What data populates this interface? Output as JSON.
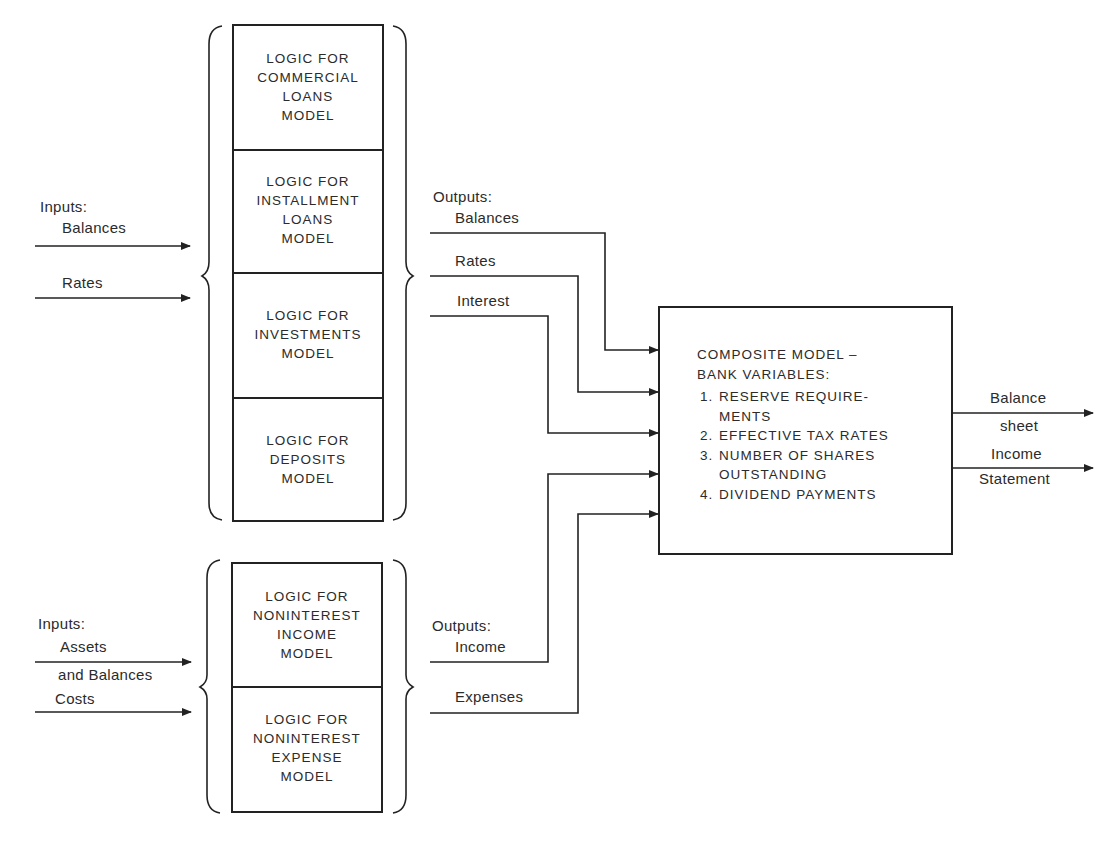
{
  "upper_group": {
    "inputs": {
      "heading": "Inputs:",
      "items": [
        "Balances",
        "Rates"
      ]
    },
    "models": [
      {
        "lines": [
          "LOGIC FOR",
          "COMMERCIAL",
          "LOANS",
          "MODEL"
        ]
      },
      {
        "lines": [
          "LOGIC FOR",
          "INSTALLMENT",
          "LOANS",
          "MODEL"
        ]
      },
      {
        "lines": [
          "LOGIC FOR",
          "INVESTMENTS",
          "MODEL"
        ]
      },
      {
        "lines": [
          "LOGIC FOR",
          "DEPOSITS",
          "MODEL"
        ]
      }
    ],
    "outputs": {
      "heading": "Outputs:",
      "items": [
        "Balances",
        "Rates",
        "Interest"
      ]
    }
  },
  "lower_group": {
    "inputs": {
      "heading": "Inputs:",
      "items": [
        "Assets",
        "and Balances",
        "Costs"
      ]
    },
    "models": [
      {
        "lines": [
          "LOGIC FOR",
          "NONINTEREST",
          "INCOME",
          "MODEL"
        ]
      },
      {
        "lines": [
          "LOGIC FOR",
          "NONINTEREST",
          "EXPENSE",
          "MODEL"
        ]
      }
    ],
    "outputs": {
      "heading": "Outputs:",
      "items": [
        "Income",
        "Expenses"
      ]
    }
  },
  "composite": {
    "title_lines": [
      "COMPOSITE MODEL –",
      "BANK VARIABLES:"
    ],
    "items": [
      {
        "num": "1.",
        "lines": [
          "RESERVE REQUIRE-",
          "MENTS"
        ]
      },
      {
        "num": "2.",
        "lines": [
          "EFFECTIVE TAX RATES"
        ]
      },
      {
        "num": "3.",
        "lines": [
          "NUMBER OF SHARES",
          "OUTSTANDING"
        ]
      },
      {
        "num": "4.",
        "lines": [
          "DIVIDEND PAYMENTS"
        ]
      }
    ]
  },
  "final_outputs": [
    {
      "above": "Balance",
      "below": "sheet"
    },
    {
      "above": "Income",
      "below": "Statement"
    }
  ],
  "colors": {
    "line": "#222222",
    "text": "#2b2b2b",
    "background": "#ffffff"
  }
}
